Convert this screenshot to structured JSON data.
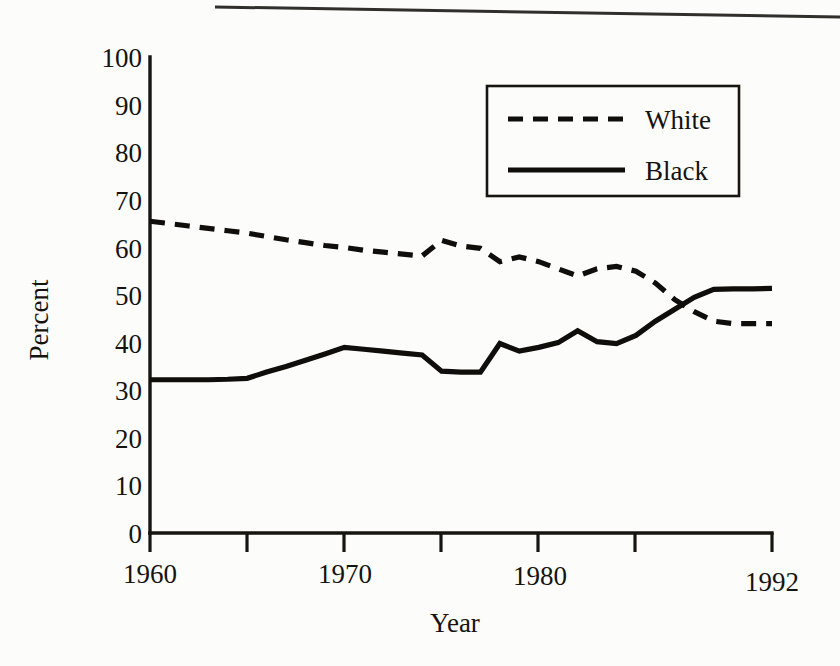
{
  "chart_data": {
    "type": "line",
    "title": "",
    "subtitle": "",
    "xlabel": "Year",
    "ylabel": "Percent",
    "xlim": [
      1960,
      1992
    ],
    "ylim": [
      0,
      100
    ],
    "grid": false,
    "legend_position": "top-right",
    "y_ticks": [
      0,
      10,
      20,
      30,
      40,
      50,
      60,
      70,
      80,
      90,
      100
    ],
    "y_tick_labels": [
      "0",
      "10",
      "20",
      "30",
      "40",
      "50",
      "60",
      "70",
      "80",
      "90",
      "100"
    ],
    "x_ticks": [
      1960,
      1965,
      1970,
      1975,
      1980,
      1985,
      1992
    ],
    "x_tick_labels": [
      "1960",
      "",
      "1970",
      "",
      "1980",
      "",
      "1992"
    ],
    "x_labeled_ticks": [
      {
        "year": 1960,
        "label": "1960"
      },
      {
        "year": 1970,
        "label": "1970"
      },
      {
        "year": 1980,
        "label": "1980"
      },
      {
        "year": 1992,
        "label": "1992"
      }
    ],
    "x": [
      1960,
      1961,
      1962,
      1963,
      1964,
      1965,
      1966,
      1967,
      1968,
      1969,
      1970,
      1971,
      1972,
      1973,
      1974,
      1975,
      1976,
      1977,
      1978,
      1979,
      1980,
      1981,
      1982,
      1983,
      1984,
      1985,
      1986,
      1987,
      1988,
      1989,
      1990,
      1991,
      1992
    ],
    "series": [
      {
        "name": "White",
        "style": "dashed",
        "color": "#100e0a",
        "values": [
          65.5,
          65.0,
          64.5,
          64.0,
          63.5,
          63.0,
          62.3,
          61.6,
          61.0,
          60.4,
          60.0,
          59.4,
          59.0,
          58.6,
          58.2,
          61.5,
          60.3,
          59.8,
          57.0,
          58.0,
          57.0,
          55.5,
          54.0,
          55.5,
          56.0,
          55.0,
          52.5,
          49.0,
          46.5,
          44.5,
          44.0,
          44.0,
          44.0
        ]
      },
      {
        "name": "Black",
        "style": "solid",
        "color": "#100e0a",
        "values": [
          32.2,
          32.2,
          32.2,
          32.2,
          32.3,
          32.5,
          33.8,
          35.0,
          36.3,
          37.6,
          39.0,
          38.6,
          38.2,
          37.8,
          37.4,
          34.0,
          33.8,
          33.8,
          39.8,
          38.2,
          39.0,
          40.0,
          42.5,
          40.2,
          39.8,
          41.5,
          44.5,
          47.0,
          49.5,
          51.2,
          51.3,
          51.3,
          51.4
        ]
      }
    ],
    "legend": [
      {
        "label": "White",
        "style": "dashed"
      },
      {
        "label": "Black",
        "style": "solid"
      }
    ]
  }
}
